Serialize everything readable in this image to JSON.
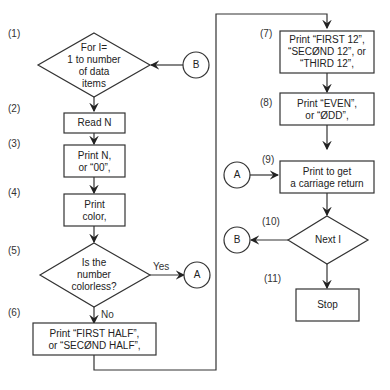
{
  "steps": {
    "s1": {
      "num": "(1)",
      "text_lines": [
        "For I=",
        "1 to number",
        "of data",
        "items"
      ]
    },
    "s2": {
      "num": "(2)",
      "text": "Read N"
    },
    "s3": {
      "num": "(3)",
      "text_lines": [
        "Print N,",
        "or “00”,"
      ]
    },
    "s4": {
      "num": "(4)",
      "text_lines": [
        "Print",
        "color,"
      ]
    },
    "s5": {
      "num": "(5)",
      "text_lines": [
        "Is the",
        "number",
        "colorless?"
      ],
      "yes": "Yes",
      "no": "No"
    },
    "s6": {
      "num": "(6)",
      "text_lines": [
        "Print “FIRST HALF”,",
        "or “SECØND HALF”,"
      ]
    },
    "s7": {
      "num": "(7)",
      "text_lines": [
        "Print “FIRST 12”,",
        "“SECØND 12”, or",
        "“THIRD 12”,"
      ]
    },
    "s8": {
      "num": "(8)",
      "text_lines": [
        "Print “EVEN”,",
        "or “ØDD”,"
      ]
    },
    "s9": {
      "num": "(9)",
      "text_lines": [
        "Print to get",
        "a carriage return"
      ]
    },
    "s10": {
      "num": "(10)",
      "text": "Next I"
    },
    "s11": {
      "num": "(11)",
      "text": "Stop"
    }
  },
  "connectors": {
    "A": "A",
    "B": "B"
  }
}
